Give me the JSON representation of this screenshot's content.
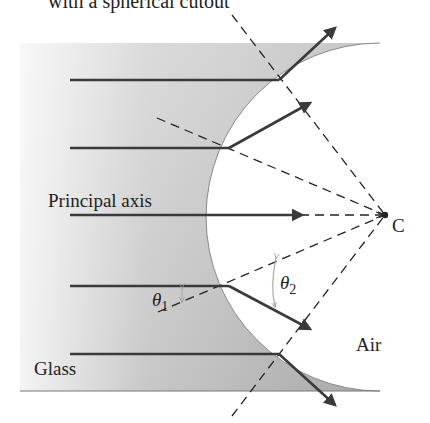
{
  "title_partial": "with a spherical cutout",
  "labels": {
    "principal_axis": "Principal axis",
    "center": "C",
    "theta1": "θ",
    "theta1_sub": "1",
    "theta2": "θ",
    "theta2_sub": "2",
    "air": "Air",
    "glass": "Glass"
  },
  "colors": {
    "glass_dark": "#a9a9a9",
    "glass_light": "#f3f3f3",
    "ray": "#3a3a3a",
    "dashed": "#222222",
    "angle_arrow": "#aaaaaa"
  }
}
